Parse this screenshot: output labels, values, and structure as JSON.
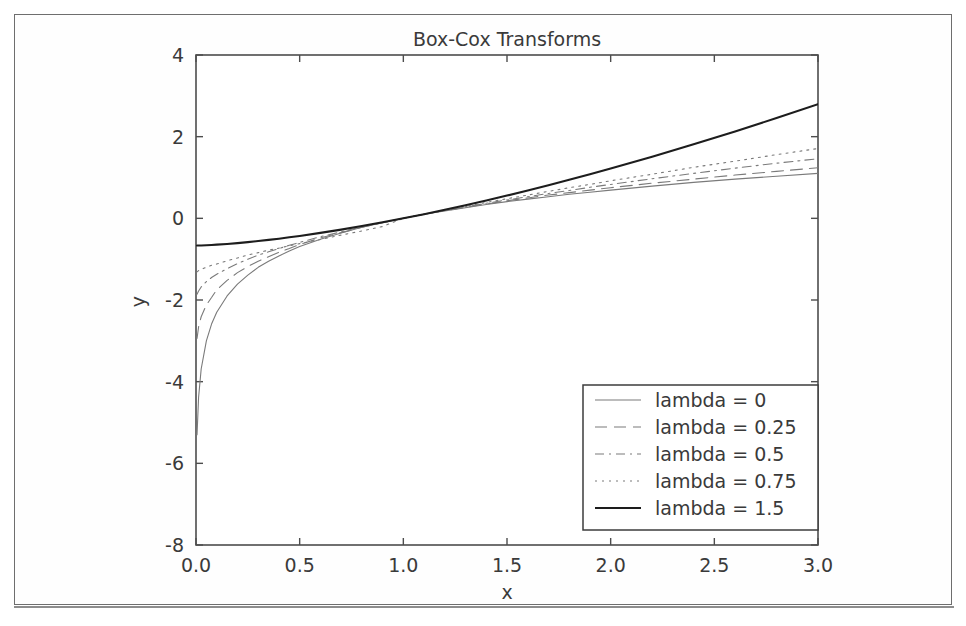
{
  "figure": {
    "background_color": "#ffffff",
    "frame_color": "#6e6e6e",
    "axes_color": "#4d4d4d"
  },
  "chart_data": {
    "type": "line",
    "title": "Box-Cox Transforms",
    "xlabel": "x",
    "ylabel": "y",
    "xlim": [
      0.0,
      3.0
    ],
    "ylim": [
      -8,
      4
    ],
    "xticks": [
      "0.0",
      "0.5",
      "1.0",
      "1.5",
      "2.0",
      "2.5",
      "3.0"
    ],
    "xtick_values": [
      0.0,
      0.5,
      1.0,
      1.5,
      2.0,
      2.5,
      3.0
    ],
    "yticks": [
      "4",
      "2",
      "0",
      "-2",
      "-4",
      "-6",
      "-8"
    ],
    "ytick_values": [
      4,
      2,
      0,
      -2,
      -4,
      -6,
      -8
    ],
    "grid": false,
    "legend_position": "lower right",
    "x": [
      0.005,
      0.0125,
      0.025,
      0.05,
      0.075,
      0.1,
      0.15,
      0.2,
      0.25,
      0.3,
      0.35,
      0.4,
      0.45,
      0.5,
      0.6,
      0.7,
      0.8,
      0.9,
      1.0,
      1.1,
      1.2,
      1.3,
      1.4,
      1.5,
      1.6,
      1.7,
      1.8,
      1.9,
      2.0,
      2.2,
      2.4,
      2.6,
      2.8,
      3.0
    ],
    "series": [
      {
        "name": "lambda = 0",
        "lambda": 0,
        "formula": "log(x)",
        "dash": "none",
        "width": 1.1,
        "color": "#7a7a7a",
        "values": [
          -5.3,
          -4.38,
          -3.69,
          -3.0,
          -2.59,
          -2.3,
          -1.9,
          -1.61,
          -1.39,
          -1.2,
          -1.05,
          -0.92,
          -0.8,
          -0.69,
          -0.51,
          -0.36,
          -0.22,
          -0.11,
          0.0,
          0.1,
          0.18,
          0.26,
          0.34,
          0.41,
          0.47,
          0.53,
          0.59,
          0.64,
          0.69,
          0.79,
          0.88,
          0.96,
          1.03,
          1.1
        ],
        "y_at_x0": -4.3
      },
      {
        "name": "lambda = 0.25",
        "lambda": 0.25,
        "formula": "(x^0.25 - 1)/0.25",
        "dash": "12,7",
        "width": 1.1,
        "color": "#7a7a7a",
        "values": [
          -2.94,
          -2.66,
          -2.41,
          -2.12,
          -1.94,
          -1.75,
          -1.52,
          -1.33,
          -1.18,
          -1.05,
          -0.94,
          -0.83,
          -0.74,
          -0.64,
          -0.48,
          -0.35,
          -0.22,
          -0.11,
          0.0,
          0.1,
          0.19,
          0.27,
          0.35,
          0.43,
          0.5,
          0.57,
          0.63,
          0.69,
          0.75,
          0.86,
          0.96,
          1.06,
          1.15,
          1.24
        ],
        "y_at_x0": -2.6
      },
      {
        "name": "lambda = 0.5",
        "lambda": 0.5,
        "formula": "(x^0.5 - 1)/0.5",
        "dash": "9,5,2,5",
        "width": 1.1,
        "color": "#7a7a7a",
        "values": [
          -1.86,
          -1.78,
          -1.68,
          -1.55,
          -1.45,
          -1.37,
          -1.23,
          -1.11,
          -1.0,
          -0.9,
          -0.82,
          -0.74,
          -0.66,
          -0.59,
          -0.45,
          -0.33,
          -0.21,
          -0.1,
          0.0,
          0.1,
          0.19,
          0.28,
          0.37,
          0.45,
          0.53,
          0.61,
          0.68,
          0.76,
          0.83,
          0.97,
          1.1,
          1.23,
          1.35,
          1.46
        ],
        "y_at_x0": -1.85
      },
      {
        "name": "lambda = 0.75",
        "lambda": 0.75,
        "formula": "(x^0.75 - 1)/0.75",
        "dash": "2,5",
        "width": 1.1,
        "color": "#7a7a7a",
        "values": [
          -1.31,
          -1.28,
          -1.25,
          -1.2,
          -1.15,
          -1.12,
          -1.04,
          -0.97,
          -0.9,
          -0.84,
          -0.78,
          -0.73,
          -0.67,
          -0.62,
          -0.52,
          -0.41,
          -0.31,
          -0.2,
          0.0,
          0.1,
          0.2,
          0.29,
          0.39,
          0.48,
          0.57,
          0.66,
          0.75,
          0.83,
          0.92,
          1.08,
          1.25,
          1.4,
          1.56,
          1.71
        ],
        "y_at_x0": -1.33
      },
      {
        "name": "lambda = 1.5",
        "lambda": 1.5,
        "formula": "(x^1.5 - 1)/1.5",
        "dash": "none",
        "width": 2.1,
        "color": "#1d1d1d",
        "values": [
          -0.666,
          -0.666,
          -0.664,
          -0.659,
          -0.653,
          -0.645,
          -0.628,
          -0.607,
          -0.583,
          -0.557,
          -0.528,
          -0.498,
          -0.465,
          -0.431,
          -0.357,
          -0.276,
          -0.189,
          -0.097,
          0.0,
          0.102,
          0.209,
          0.321,
          0.437,
          0.558,
          0.683,
          0.811,
          0.943,
          1.079,
          1.219,
          1.509,
          1.812,
          2.128,
          2.455,
          2.794
        ],
        "y_at_x0": -0.667
      }
    ]
  },
  "legend": {
    "entries": [
      {
        "label": "lambda = 0"
      },
      {
        "label": "lambda = 0.25"
      },
      {
        "label": "lambda = 0.5"
      },
      {
        "label": "lambda = 0.75"
      },
      {
        "label": "lambda = 1.5"
      }
    ]
  }
}
